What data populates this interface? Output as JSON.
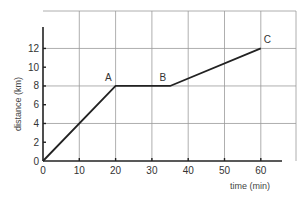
{
  "chart_data": {
    "type": "line",
    "title": "",
    "xlabel": "time (min)",
    "ylabel": "distance (km)",
    "xlim": [
      0,
      70
    ],
    "ylim": [
      0,
      16
    ],
    "x_ticks": [
      "0",
      "10",
      "20",
      "30",
      "40",
      "50",
      "60"
    ],
    "y_ticks": [
      "0",
      "2",
      "4",
      "6",
      "8",
      "10",
      "12"
    ],
    "grid": true,
    "legend": null,
    "series": [
      {
        "name": "journey",
        "points": [
          {
            "x": 0,
            "y": 0,
            "label": ""
          },
          {
            "x": 20,
            "y": 8,
            "label": "A"
          },
          {
            "x": 35,
            "y": 8,
            "label": "B"
          },
          {
            "x": 60,
            "y": 12,
            "label": "C"
          }
        ]
      }
    ],
    "annotations": [
      "A",
      "B",
      "C"
    ]
  }
}
